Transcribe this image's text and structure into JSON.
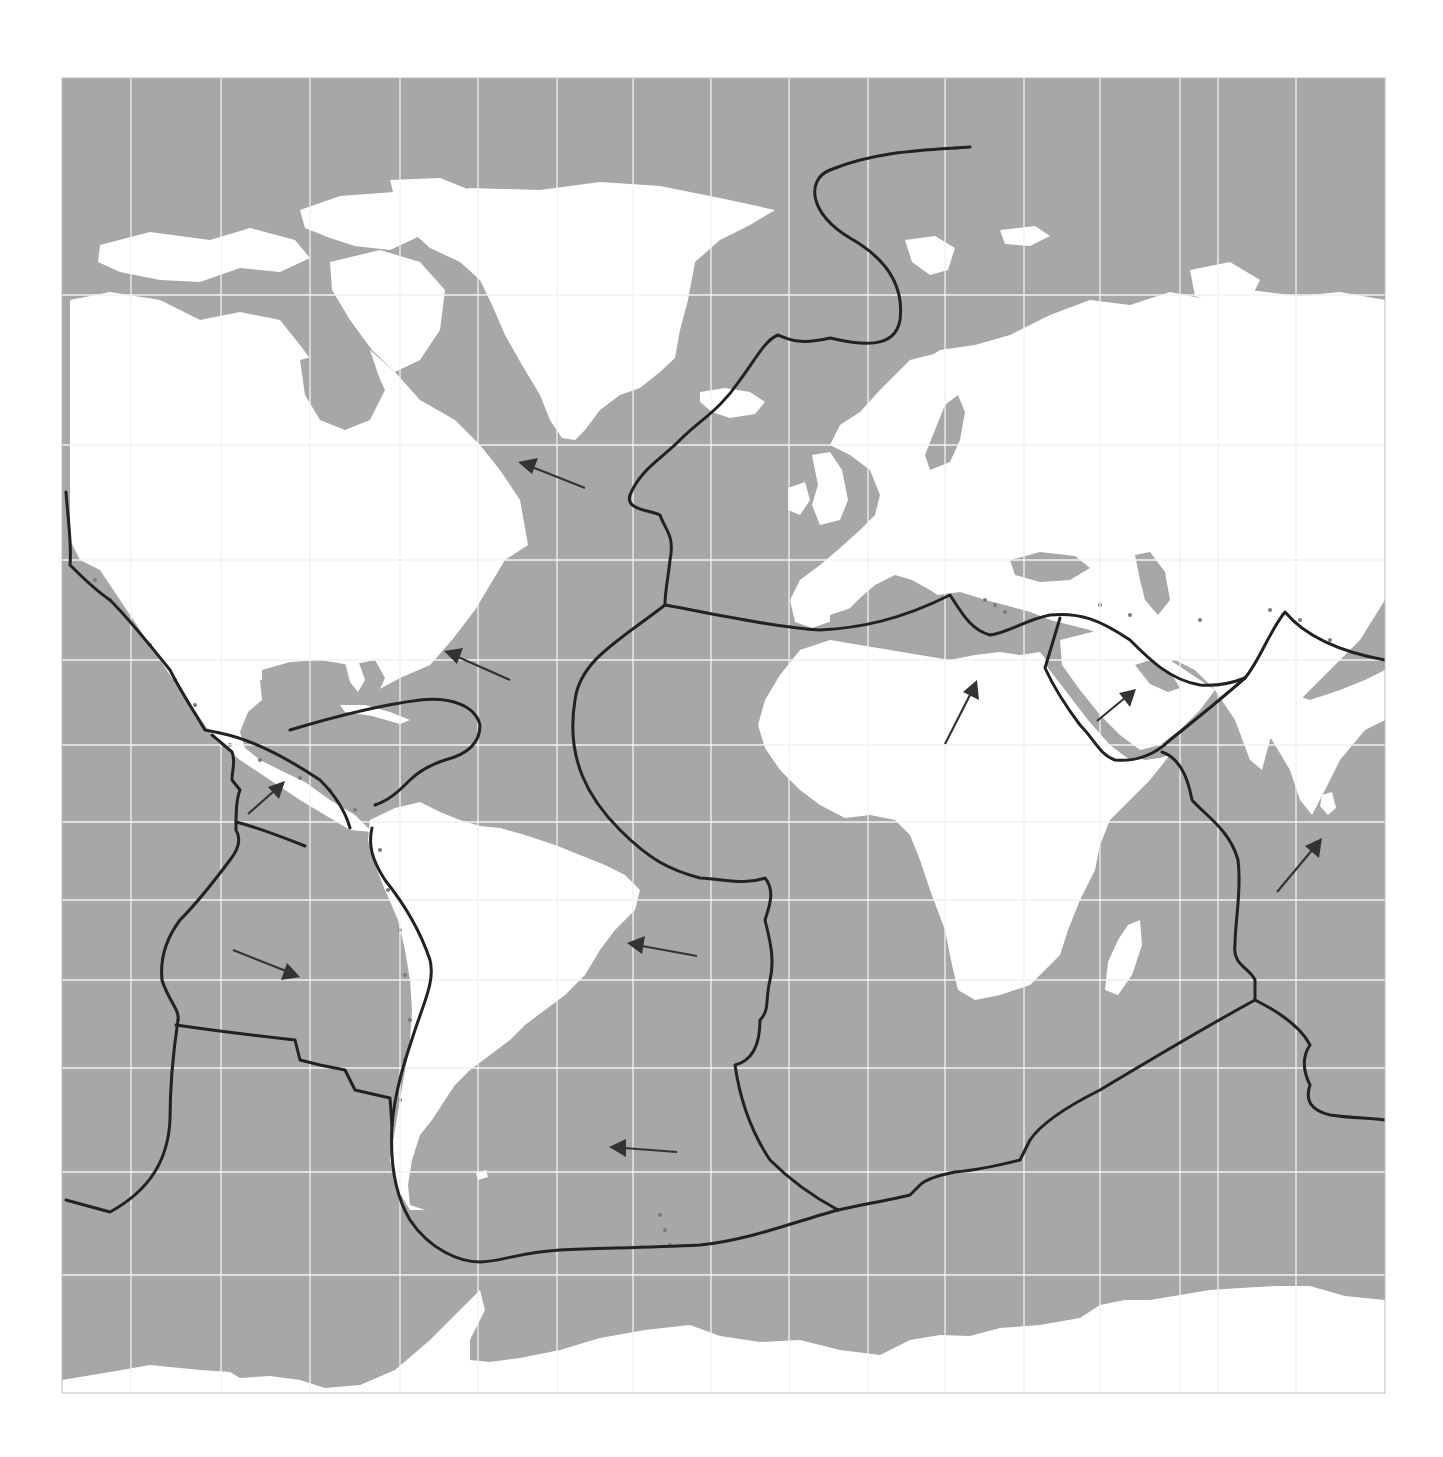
{
  "map": {
    "type": "world-map-plate-tectonics",
    "projection": "mercator",
    "colors": {
      "ocean": "#a7a7a7",
      "land": "#ffffff",
      "grid": "#f2f2f2",
      "plate_boundary": "#222222",
      "arrow": "#333333",
      "earthquake_dots": "#7a7a7a"
    },
    "frame": {
      "x": 62,
      "y": 78,
      "width": 1323,
      "height": 1315
    },
    "grid": {
      "vertical_x": [
        131,
        221,
        310,
        400,
        478,
        557,
        633,
        711,
        789,
        868,
        945,
        1024,
        1100,
        1180,
        1218,
        1296
      ],
      "horizontal_y": [
        295,
        445,
        560,
        660,
        745,
        822,
        900,
        980,
        1068,
        1172,
        1275
      ]
    },
    "plate_motion_arrows": [
      {
        "id": "north-american-1",
        "from": [
          585,
          488
        ],
        "to": [
          520,
          462
        ],
        "direction": "west-northwest"
      },
      {
        "id": "north-american-2",
        "from": [
          510,
          680
        ],
        "to": [
          445,
          652
        ],
        "direction": "west-northwest"
      },
      {
        "id": "cocos",
        "from": [
          248,
          814
        ],
        "to": [
          283,
          783
        ],
        "direction": "northeast"
      },
      {
        "id": "nazca",
        "from": [
          233,
          950
        ],
        "to": [
          298,
          976
        ],
        "direction": "east-southeast"
      },
      {
        "id": "south-american-1",
        "from": [
          697,
          956
        ],
        "to": [
          628,
          943
        ],
        "direction": "west"
      },
      {
        "id": "south-american-2",
        "from": [
          677,
          1152
        ],
        "to": [
          610,
          1147
        ],
        "direction": "west"
      },
      {
        "id": "african",
        "from": [
          945,
          744
        ],
        "to": [
          977,
          682
        ],
        "direction": "north-northeast"
      },
      {
        "id": "arabian",
        "from": [
          1097,
          721
        ],
        "to": [
          1135,
          690
        ],
        "direction": "northeast"
      },
      {
        "id": "indo-australian",
        "from": [
          1277,
          892
        ],
        "to": [
          1322,
          838
        ],
        "direction": "northeast"
      }
    ],
    "labels": []
  }
}
